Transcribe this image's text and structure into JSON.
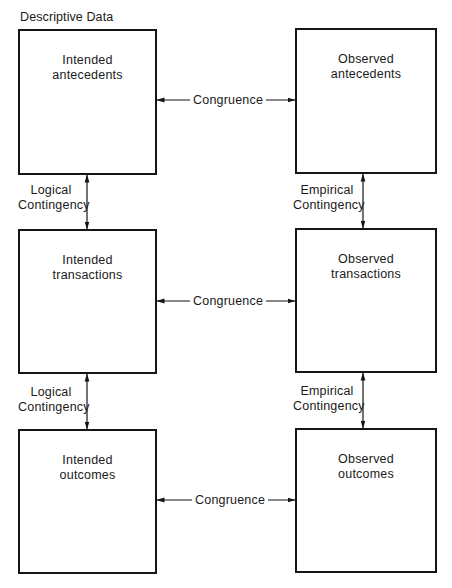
{
  "diagram": {
    "title": "Descriptive Data",
    "colors": {
      "line": "#151515",
      "background": "#ffffff",
      "text": "#1a1a1a"
    },
    "boxes": {
      "intended_antecedents": {
        "line1": "Intended",
        "line2": "antecedents"
      },
      "observed_antecedents": {
        "line1": "Observed",
        "line2": "antecedents"
      },
      "intended_transactions": {
        "line1": "Intended",
        "line2": "transactions"
      },
      "observed_transactions": {
        "line1": "Observed",
        "line2": "transactions"
      },
      "intended_outcomes": {
        "line1": "Intended",
        "line2": "outcomes"
      },
      "observed_outcomes": {
        "line1": "Observed",
        "line2": "outcomes"
      }
    },
    "congruence": {
      "row1": "Congruence",
      "row2": "Congruence",
      "row3": "Congruence"
    },
    "contingency": {
      "left_upper": {
        "line1": "Logical",
        "line2": "Contingency"
      },
      "left_lower": {
        "line1": "Logical",
        "line2": "Contingency"
      },
      "right_upper": {
        "line1": "Empirical",
        "line2": "Contingency"
      },
      "right_lower": {
        "line1": "Empirical",
        "line2": "Contingency"
      }
    },
    "edges": [
      {
        "from": "Intended antecedents",
        "to": "Observed antecedents",
        "label": "Congruence",
        "direction": "bidirectional"
      },
      {
        "from": "Intended transactions",
        "to": "Observed transactions",
        "label": "Congruence",
        "direction": "bidirectional"
      },
      {
        "from": "Intended outcomes",
        "to": "Observed outcomes",
        "label": "Congruence",
        "direction": "bidirectional"
      },
      {
        "from": "Intended antecedents",
        "to": "Intended transactions",
        "label": "Logical Contingency",
        "direction": "bidirectional"
      },
      {
        "from": "Intended transactions",
        "to": "Intended outcomes",
        "label": "Logical Contingency",
        "direction": "bidirectional"
      },
      {
        "from": "Observed antecedents",
        "to": "Observed transactions",
        "label": "Empirical Contingency",
        "direction": "bidirectional"
      },
      {
        "from": "Observed transactions",
        "to": "Observed outcomes",
        "label": "Empirical Contingency",
        "direction": "bidirectional"
      }
    ]
  }
}
